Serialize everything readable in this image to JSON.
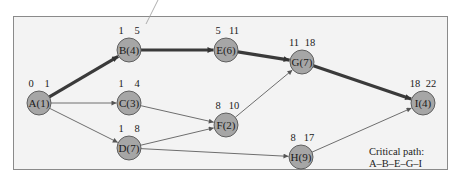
{
  "diagram": {
    "type": "critical-path-network",
    "nodes": [
      {
        "id": "A",
        "label": "A(1)",
        "duration": 1,
        "es": "0",
        "ef": "1",
        "x": 39,
        "y": 103,
        "critical": true
      },
      {
        "id": "B",
        "label": "B(4)",
        "duration": 4,
        "es": "1",
        "ef": "5",
        "x": 129,
        "y": 50,
        "critical": true
      },
      {
        "id": "C",
        "label": "C(3)",
        "duration": 3,
        "es": "1",
        "ef": "4",
        "x": 129,
        "y": 103,
        "critical": false
      },
      {
        "id": "D",
        "label": "D(7)",
        "duration": 7,
        "es": "1",
        "ef": "8",
        "x": 129,
        "y": 148,
        "critical": false
      },
      {
        "id": "E",
        "label": "E(6)",
        "duration": 6,
        "es": "5",
        "ef": "11",
        "x": 226,
        "y": 50,
        "critical": true
      },
      {
        "id": "F",
        "label": "F(2)",
        "duration": 2,
        "es": "8",
        "ef": "10",
        "x": 226,
        "y": 125,
        "critical": false
      },
      {
        "id": "G",
        "label": "G(7)",
        "duration": 7,
        "es": "11",
        "ef": "18",
        "x": 302,
        "y": 62,
        "critical": true
      },
      {
        "id": "H",
        "label": "H(9)",
        "duration": 9,
        "es": "8",
        "ef": "17",
        "x": 301,
        "y": 157,
        "critical": false
      },
      {
        "id": "I",
        "label": "I(4)",
        "duration": 4,
        "es": "18",
        "ef": "22",
        "x": 423,
        "y": 103,
        "critical": true
      }
    ],
    "edges": [
      {
        "from": "A",
        "to": "B",
        "critical": true
      },
      {
        "from": "A",
        "to": "C",
        "critical": false
      },
      {
        "from": "A",
        "to": "D",
        "critical": false
      },
      {
        "from": "B",
        "to": "E",
        "critical": true
      },
      {
        "from": "C",
        "to": "F",
        "critical": false
      },
      {
        "from": "D",
        "to": "F",
        "critical": false
      },
      {
        "from": "D",
        "to": "H",
        "critical": false
      },
      {
        "from": "E",
        "to": "G",
        "critical": true
      },
      {
        "from": "F",
        "to": "G",
        "critical": false
      },
      {
        "from": "G",
        "to": "I",
        "critical": true
      },
      {
        "from": "H",
        "to": "I",
        "critical": false
      }
    ],
    "critical_path": {
      "title": "Critical path:",
      "sequence": "A–B–E–G–I"
    },
    "colors": {
      "node_fill": "#a6a6a6",
      "node_stroke": "#555555",
      "critical_edge": "#3a3a3a",
      "normal_edge": "#6e6e6e",
      "background": "#f3f3f3",
      "frame": "#8a8a8a"
    }
  }
}
